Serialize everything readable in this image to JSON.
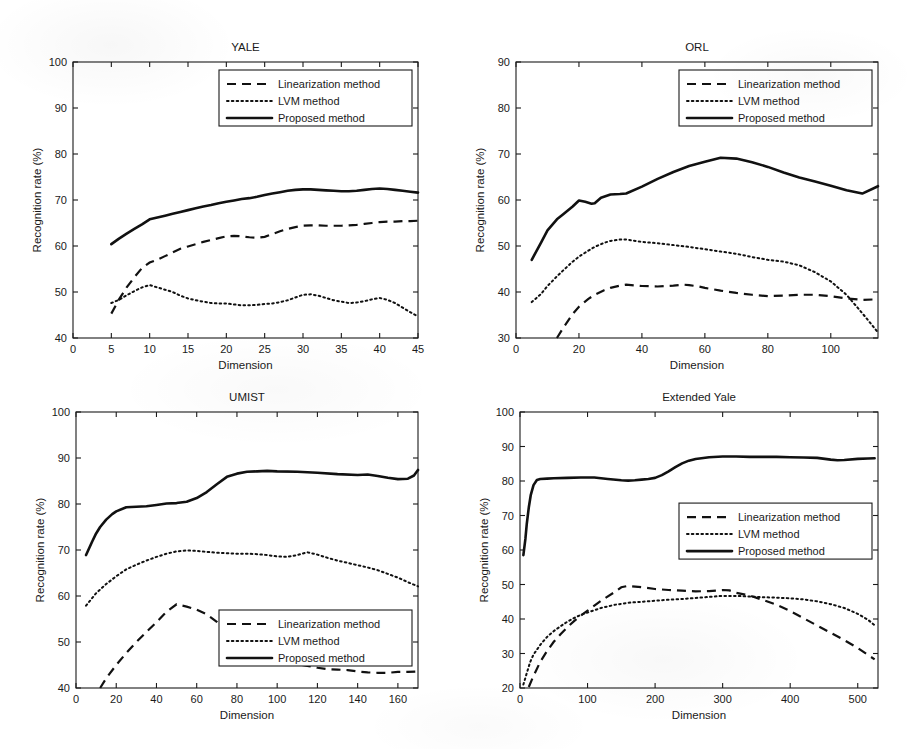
{
  "figure": {
    "caption_axis_label_x": "Dimension",
    "caption_axis_label_y": "Recognition rate (%)",
    "legend_entries": [
      "Linearization method",
      "LVM method",
      "Proposed method"
    ],
    "background_color": "#ffffff",
    "line_color": "#111111"
  },
  "chart_data": [
    {
      "id": "yale",
      "type": "line",
      "title": "YALE",
      "xlabel": "Dimension",
      "ylabel": "Recognition rate (%)",
      "xlim": [
        0,
        45
      ],
      "ylim": [
        40,
        100
      ],
      "xticks": [
        0,
        5,
        10,
        15,
        20,
        25,
        30,
        35,
        40,
        45
      ],
      "yticks": [
        40,
        50,
        60,
        70,
        80,
        90,
        100
      ],
      "grid": false,
      "legend_position": "top-right-inside",
      "series": [
        {
          "name": "Linearization method",
          "style": "dashed",
          "x": [
            5,
            6,
            7,
            8,
            9,
            10,
            11,
            12,
            13,
            14,
            15,
            16,
            17,
            18,
            19,
            20,
            21,
            22,
            23,
            24,
            25,
            26,
            27,
            28,
            29,
            30,
            31,
            32,
            33,
            34,
            35,
            36,
            37,
            38,
            39,
            40,
            41,
            42,
            43,
            44,
            45
          ],
          "values": [
            45.3,
            48.4,
            51.0,
            53.2,
            55.2,
            56.4,
            57.0,
            57.8,
            58.6,
            59.4,
            59.9,
            60.4,
            60.9,
            61.3,
            61.7,
            62.1,
            62.2,
            62.1,
            61.9,
            61.8,
            62.0,
            62.6,
            63.2,
            63.7,
            64.1,
            64.4,
            64.5,
            64.5,
            64.4,
            64.4,
            64.4,
            64.5,
            64.6,
            64.8,
            65.0,
            65.2,
            65.3,
            65.3,
            65.4,
            65.4,
            65.5
          ]
        },
        {
          "name": "LVM method",
          "style": "dotted",
          "x": [
            5,
            6,
            7,
            8,
            9,
            10,
            11,
            12,
            13,
            14,
            15,
            16,
            17,
            18,
            19,
            20,
            21,
            22,
            23,
            24,
            25,
            26,
            27,
            28,
            29,
            30,
            31,
            32,
            33,
            34,
            35,
            36,
            37,
            38,
            39,
            40,
            41,
            42,
            43,
            44,
            45
          ],
          "values": [
            47.6,
            48.3,
            49.3,
            50.2,
            51.0,
            51.5,
            51.0,
            50.5,
            50.0,
            49.2,
            48.6,
            48.2,
            47.9,
            47.6,
            47.5,
            47.5,
            47.3,
            47.1,
            47.1,
            47.2,
            47.4,
            47.5,
            47.8,
            48.2,
            48.8,
            49.4,
            49.5,
            49.2,
            48.7,
            48.2,
            47.9,
            47.6,
            47.7,
            48.0,
            48.4,
            48.7,
            48.3,
            47.6,
            46.6,
            45.6,
            44.7
          ]
        },
        {
          "name": "Proposed method",
          "style": "solid",
          "x": [
            5,
            6,
            7,
            8,
            9,
            10,
            11,
            12,
            13,
            14,
            15,
            16,
            17,
            18,
            19,
            20,
            21,
            22,
            23,
            24,
            25,
            26,
            27,
            28,
            29,
            30,
            31,
            32,
            33,
            34,
            35,
            36,
            37,
            38,
            39,
            40,
            41,
            42,
            43,
            44,
            45
          ],
          "values": [
            60.4,
            61.6,
            62.7,
            63.7,
            64.7,
            65.8,
            66.2,
            66.6,
            67.0,
            67.4,
            67.8,
            68.2,
            68.6,
            68.9,
            69.3,
            69.6,
            69.9,
            70.2,
            70.4,
            70.7,
            71.1,
            71.4,
            71.7,
            72.0,
            72.2,
            72.3,
            72.3,
            72.2,
            72.1,
            72.0,
            71.9,
            71.9,
            72.0,
            72.2,
            72.4,
            72.5,
            72.4,
            72.2,
            72.0,
            71.8,
            71.6
          ]
        }
      ]
    },
    {
      "id": "orl",
      "type": "line",
      "title": "ORL",
      "xlabel": "Dimension",
      "ylabel": "Recognition rate (%)",
      "xlim": [
        0,
        115
      ],
      "ylim": [
        30,
        90
      ],
      "xticks": [
        0,
        20,
        40,
        60,
        80,
        100
      ],
      "yticks": [
        30,
        40,
        50,
        60,
        70,
        80,
        90
      ],
      "grid": false,
      "legend_position": "top-right-inside",
      "series": [
        {
          "name": "Linearization method",
          "style": "dashed",
          "x": [
            13,
            15,
            18,
            20,
            23,
            25,
            28,
            30,
            33,
            35,
            38,
            40,
            45,
            50,
            53,
            55,
            58,
            60,
            65,
            70,
            75,
            80,
            85,
            90,
            95,
            100,
            105,
            110,
            115
          ],
          "values": [
            30.0,
            32.2,
            35.2,
            36.8,
            38.5,
            39.4,
            40.4,
            40.9,
            41.4,
            41.6,
            41.4,
            41.3,
            41.2,
            41.4,
            41.6,
            41.5,
            41.2,
            40.9,
            40.3,
            39.8,
            39.4,
            39.1,
            39.2,
            39.4,
            39.4,
            39.1,
            38.6,
            38.3,
            38.4
          ]
        },
        {
          "name": "LVM method",
          "style": "dotted",
          "x": [
            5,
            8,
            10,
            13,
            15,
            18,
            20,
            23,
            25,
            28,
            30,
            33,
            35,
            38,
            40,
            45,
            50,
            55,
            60,
            65,
            70,
            75,
            80,
            85,
            90,
            95,
            100,
            105,
            110,
            115
          ],
          "values": [
            37.8,
            39.6,
            41.3,
            43.4,
            44.7,
            46.6,
            47.7,
            49.0,
            49.8,
            50.7,
            51.1,
            51.4,
            51.4,
            51.1,
            50.9,
            50.6,
            50.2,
            49.8,
            49.3,
            48.8,
            48.3,
            47.6,
            47.0,
            46.6,
            45.8,
            44.3,
            42.3,
            39.4,
            35.4,
            31.2
          ]
        },
        {
          "name": "Proposed method",
          "style": "solid",
          "x": [
            5,
            8,
            10,
            13,
            15,
            18,
            20,
            22,
            24,
            25,
            27,
            30,
            33,
            35,
            40,
            45,
            50,
            55,
            60,
            65,
            70,
            75,
            80,
            85,
            90,
            95,
            100,
            105,
            110,
            115
          ],
          "values": [
            47.0,
            50.8,
            53.4,
            55.8,
            56.9,
            58.6,
            59.9,
            59.6,
            59.2,
            59.3,
            60.5,
            61.2,
            61.3,
            61.4,
            62.9,
            64.6,
            66.1,
            67.4,
            68.3,
            69.2,
            69.0,
            68.2,
            67.2,
            66.0,
            64.9,
            64.0,
            63.1,
            62.1,
            61.4,
            63.0
          ]
        }
      ]
    },
    {
      "id": "umist",
      "type": "line",
      "title": "UMIST",
      "xlabel": "Dimension",
      "ylabel": "Recognition rate (%)",
      "xlim": [
        0,
        170
      ],
      "ylim": [
        40,
        100
      ],
      "xticks": [
        0,
        20,
        40,
        60,
        80,
        100,
        120,
        140,
        160
      ],
      "yticks": [
        40,
        50,
        60,
        70,
        80,
        90,
        100
      ],
      "grid": false,
      "legend_position": "bottom-right-inside",
      "series": [
        {
          "name": "Linearization method",
          "style": "dashed",
          "x": [
            12,
            15,
            20,
            25,
            30,
            35,
            40,
            45,
            50,
            55,
            60,
            65,
            70,
            75,
            80,
            85,
            90,
            95,
            100,
            105,
            110,
            115,
            120,
            125,
            130,
            135,
            140,
            145,
            150,
            155,
            160,
            165,
            170
          ],
          "values": [
            40.0,
            42.1,
            45.0,
            47.6,
            50.0,
            52.2,
            54.3,
            56.6,
            58.2,
            57.7,
            57.0,
            56.0,
            54.4,
            52.6,
            51.0,
            49.6,
            48.3,
            47.2,
            46.3,
            45.7,
            45.2,
            44.8,
            44.4,
            44.1,
            44.0,
            43.9,
            43.6,
            43.4,
            43.3,
            43.3,
            43.5,
            43.5,
            43.6
          ]
        },
        {
          "name": "LVM method",
          "style": "dotted",
          "x": [
            5,
            10,
            15,
            20,
            25,
            30,
            35,
            40,
            45,
            50,
            55,
            60,
            65,
            70,
            75,
            80,
            85,
            90,
            95,
            100,
            105,
            110,
            115,
            120,
            125,
            130,
            135,
            140,
            145,
            150,
            155,
            160,
            165,
            170
          ],
          "values": [
            57.9,
            60.6,
            62.6,
            64.3,
            65.8,
            66.8,
            67.7,
            68.5,
            69.2,
            69.7,
            69.9,
            69.8,
            69.6,
            69.4,
            69.3,
            69.2,
            69.2,
            69.1,
            68.9,
            68.6,
            68.5,
            68.9,
            69.5,
            69.0,
            68.3,
            67.7,
            67.2,
            66.7,
            66.2,
            65.6,
            64.8,
            64.0,
            63.0,
            62.1
          ]
        },
        {
          "name": "Proposed method",
          "style": "solid",
          "x": [
            5,
            8,
            10,
            12,
            15,
            18,
            20,
            25,
            30,
            35,
            40,
            45,
            50,
            55,
            60,
            65,
            70,
            75,
            80,
            85,
            90,
            95,
            100,
            110,
            120,
            130,
            140,
            145,
            150,
            155,
            160,
            165,
            168,
            170
          ],
          "values": [
            68.9,
            71.8,
            73.6,
            75.0,
            76.6,
            77.8,
            78.4,
            79.3,
            79.4,
            79.5,
            79.8,
            80.1,
            80.2,
            80.5,
            81.3,
            82.6,
            84.3,
            85.9,
            86.6,
            87.0,
            87.1,
            87.2,
            87.1,
            87.0,
            86.8,
            86.5,
            86.3,
            86.4,
            86.1,
            85.7,
            85.4,
            85.5,
            86.2,
            87.4
          ]
        }
      ]
    },
    {
      "id": "extended-yale",
      "type": "line",
      "title": "Extended Yale",
      "xlabel": "Dimension",
      "ylabel": "Recognition rate (%)",
      "xlim": [
        0,
        530
      ],
      "ylim": [
        20,
        100
      ],
      "xticks": [
        0,
        100,
        200,
        300,
        400,
        500
      ],
      "yticks": [
        20,
        30,
        40,
        50,
        60,
        70,
        80,
        90,
        100
      ],
      "grid": false,
      "legend_position": "middle-right-inside",
      "series": [
        {
          "name": "Linearization method",
          "style": "dashed",
          "x": [
            13,
            20,
            30,
            40,
            50,
            60,
            70,
            80,
            90,
            100,
            120,
            140,
            150,
            160,
            180,
            200,
            220,
            240,
            260,
            280,
            300,
            310,
            320,
            340,
            360,
            380,
            400,
            420,
            440,
            460,
            480,
            500,
            515,
            525
          ],
          "values": [
            20.3,
            23.5,
            27.6,
            30.7,
            33.4,
            35.6,
            37.6,
            39.4,
            41.0,
            42.4,
            45.3,
            47.8,
            49.2,
            49.6,
            49.2,
            48.7,
            48.4,
            48.2,
            48.0,
            48.1,
            48.4,
            48.3,
            47.6,
            46.8,
            45.5,
            44.1,
            42.3,
            40.2,
            38.1,
            36.0,
            33.9,
            31.6,
            29.6,
            28.3
          ]
        },
        {
          "name": "LVM method",
          "style": "dotted",
          "x": [
            5,
            10,
            15,
            20,
            30,
            40,
            50,
            60,
            70,
            80,
            90,
            100,
            120,
            140,
            160,
            180,
            200,
            220,
            240,
            260,
            280,
            300,
            320,
            340,
            360,
            380,
            400,
            420,
            440,
            460,
            480,
            500,
            515,
            525
          ],
          "values": [
            21.0,
            24.3,
            27.5,
            29.7,
            32.5,
            34.8,
            36.5,
            37.9,
            39.2,
            40.3,
            41.2,
            41.9,
            43.2,
            44.1,
            44.7,
            45.0,
            45.3,
            45.6,
            45.8,
            46.1,
            46.4,
            46.7,
            46.7,
            46.5,
            46.3,
            46.2,
            46.0,
            45.7,
            45.1,
            44.3,
            43.2,
            41.5,
            39.8,
            38.2
          ]
        },
        {
          "name": "Proposed method",
          "style": "solid",
          "x": [
            5,
            8,
            10,
            13,
            16,
            20,
            25,
            30,
            40,
            50,
            70,
            90,
            110,
            130,
            150,
            160,
            170,
            180,
            190,
            200,
            210,
            220,
            230,
            240,
            250,
            260,
            280,
            300,
            320,
            340,
            360,
            380,
            400,
            420,
            440,
            460,
            470,
            480,
            500,
            515,
            525
          ],
          "values": [
            58.5,
            63.2,
            67.5,
            72.3,
            76.0,
            78.8,
            80.3,
            80.6,
            80.7,
            80.8,
            80.9,
            81.0,
            81.0,
            80.6,
            80.2,
            80.1,
            80.2,
            80.4,
            80.6,
            80.9,
            81.7,
            82.8,
            84.0,
            85.1,
            85.9,
            86.4,
            86.9,
            87.1,
            87.1,
            87.0,
            87.0,
            87.0,
            86.9,
            86.8,
            86.7,
            86.2,
            86.0,
            86.1,
            86.4,
            86.5,
            86.6
          ]
        }
      ]
    }
  ]
}
